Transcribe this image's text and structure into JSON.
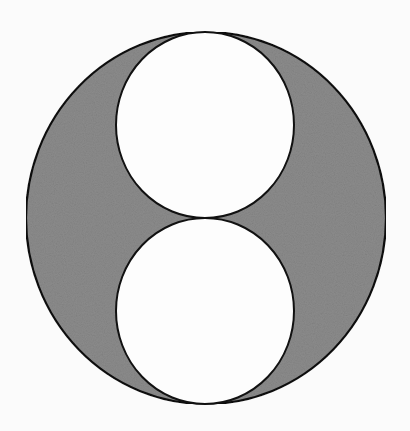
{
  "figure": {
    "background_color": "#fbfbfb",
    "stroke_color": "#111111",
    "fill_color": "#8c8c8c",
    "outer_circle": {
      "cx": 206,
      "cy": 218,
      "rx": 180,
      "ry": 186
    },
    "inner_circles": [
      {
        "name": "top",
        "cx": 205,
        "cy": 125,
        "rx": 89,
        "ry": 93
      },
      {
        "name": "bottom",
        "cx": 205,
        "cy": 311,
        "rx": 89,
        "ry": 93
      }
    ],
    "tangent_point": {
      "x": 205,
      "y": 218
    }
  }
}
